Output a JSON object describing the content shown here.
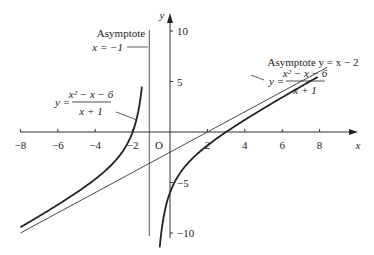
{
  "chart_data": {
    "type": "line",
    "title": "",
    "xlabel": "x",
    "ylabel": "y",
    "xlim": [
      -8,
      8.8
    ],
    "ylim": [
      -10,
      11
    ],
    "grid": false,
    "origin_label": "O",
    "x_ticks": [
      -8,
      -6,
      -4,
      -2,
      2,
      4,
      6,
      8
    ],
    "x_tick_labels": [
      "−8",
      "−6",
      "−4",
      "−2",
      "2",
      "4",
      "6",
      "8"
    ],
    "y_ticks": [
      10,
      5,
      -5,
      -10
    ],
    "y_tick_labels": [
      "10",
      "5",
      "−5",
      "−10"
    ],
    "series": [
      {
        "name": "y = (x² − x − 6)/(x + 1)",
        "function": "(x^2 - x - 6)/(x + 1)",
        "domain": "x != -1",
        "style": "thick"
      },
      {
        "name": "Asymptote y = x − 2",
        "function": "x - 2",
        "style": "thin"
      },
      {
        "name": "Asymptote x = −1",
        "vertical": -1,
        "style": "thin"
      }
    ],
    "annotations": [
      {
        "text": "Asymptote",
        "line2": "x = −1",
        "target": "vertical asymptote"
      },
      {
        "text": "Asymptote y = x − 2",
        "target": "slant asymptote"
      },
      {
        "text": "y = (x² − x − 6)/(x + 1)",
        "target": "left branch"
      },
      {
        "text": "y = (x² − x − 6)/(x + 1)",
        "target": "right branch"
      }
    ]
  },
  "labels": {
    "x_axis": "x",
    "y_axis": "y",
    "origin": "O",
    "vasym_title": "Asymptote",
    "vasym_eq": "x = −1",
    "sasym": "Asymptote y = x − 2",
    "func_y": "y =",
    "func_num": "x² − x − 6",
    "func_den": "x + 1"
  }
}
